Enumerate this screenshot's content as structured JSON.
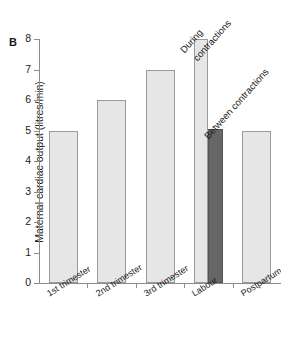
{
  "panel": {
    "letter": "B"
  },
  "axes": {
    "ylabel": "Maternal cardiac output (litres/min)",
    "yticks": [
      "0",
      "1",
      "2",
      "3",
      "4",
      "5",
      "6",
      "7",
      "8"
    ],
    "xlabel": ""
  },
  "callouts": {
    "during": "During\ncontractions",
    "during_line1": "During",
    "during_line2": "contractions",
    "between": "Between contractions"
  },
  "colors": {
    "bar_light": "#e6e6e6",
    "bar_dark": "#666666",
    "bar_edge": "#9a9a9a",
    "axis": "#8c8c8c",
    "text": "#1a1a1a",
    "background": "#ffffff"
  },
  "chart_data": {
    "type": "bar",
    "title": "",
    "xlabel": "",
    "ylabel": "Maternal cardiac output (litres/min)",
    "ylim": [
      0,
      8
    ],
    "ytick_step": 1,
    "grid": false,
    "legend": "none",
    "categories": [
      "1st trimester",
      "2nd trimester",
      "3rd trimester",
      "Labour",
      "Postpartum"
    ],
    "values": [
      5.0,
      6.0,
      7.0,
      null,
      5.0
    ],
    "bars": [
      {
        "category": "1st trimester",
        "value": 5.0,
        "fill": "light",
        "annotation": ""
      },
      {
        "category": "2nd trimester",
        "value": 6.0,
        "fill": "light",
        "annotation": ""
      },
      {
        "category": "3rd trimester",
        "value": 7.0,
        "fill": "light",
        "annotation": ""
      },
      {
        "category": "Labour",
        "value": 8.0,
        "fill": "light",
        "annotation": "During contractions"
      },
      {
        "category": "Labour",
        "value": 5.05,
        "fill": "dark",
        "annotation": "Between contractions"
      },
      {
        "category": "Postpartum",
        "value": 5.0,
        "fill": "light",
        "annotation": ""
      }
    ]
  }
}
